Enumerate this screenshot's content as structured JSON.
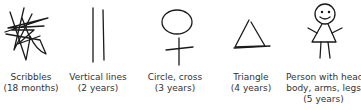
{
  "figures": [
    {
      "shape": "scribbles",
      "label": "Scribbles",
      "age": "(18 months)"
    },
    {
      "shape": "vertical-lines",
      "label": "Vertical lines",
      "age": "(2 years)"
    },
    {
      "shape": "circle-cross",
      "label": "Circle, cross",
      "age": "(3 years)"
    },
    {
      "shape": "triangle",
      "label": "Triangle",
      "age": "(4 years)"
    },
    {
      "shape": "person",
      "label": "Person with head,",
      "label2": "body, arms, legs",
      "age": "(5 years)"
    }
  ],
  "colors": {
    "ink": "#1a1a1a",
    "text": "#333333",
    "background": "#ffffff"
  }
}
